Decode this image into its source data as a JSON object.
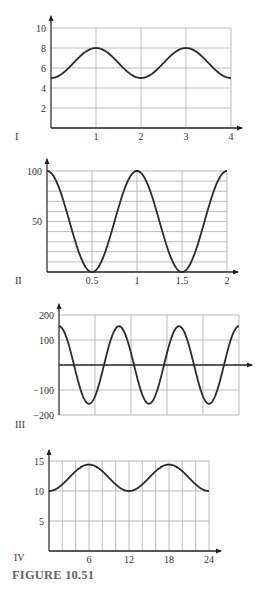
{
  "caption": "FIGURE 10.51",
  "chart_data": [
    {
      "id": "I",
      "type": "line",
      "panel_label": "I",
      "title": "",
      "xlabel": "",
      "ylabel": "",
      "xlim": [
        0,
        4
      ],
      "ylim": [
        0,
        10
      ],
      "x_ticks": [
        1,
        2,
        3,
        4
      ],
      "x_tick_labels": [
        "1",
        "2",
        "3",
        "4"
      ],
      "y_ticks": [
        2,
        4,
        6,
        8,
        10
      ],
      "y_tick_labels": [
        "2",
        "4",
        "6",
        "8",
        "10"
      ],
      "grid": true,
      "v_grid": [
        1,
        2,
        3,
        4
      ],
      "h_grid": [
        2,
        4,
        6,
        8,
        10
      ],
      "series": [
        {
          "name": "curve",
          "formula": "6.5 - 1.5*cos(pi*x)",
          "x": [
            0,
            0.5,
            1,
            1.5,
            2,
            2.5,
            3,
            3.5,
            4
          ],
          "values": [
            5,
            6.5,
            8,
            6.5,
            5,
            6.5,
            8,
            6.5,
            5
          ]
        }
      ],
      "px": {
        "x0": 51,
        "x1": 231,
        "y0": 128,
        "y1": 28,
        "yTop": 16,
        "xArrow": 242,
        "labelX": 15,
        "labelY": 140
      }
    },
    {
      "id": "II",
      "type": "line",
      "panel_label": "II",
      "title": "",
      "xlabel": "",
      "ylabel": "",
      "xlim": [
        0,
        2
      ],
      "ylim": [
        0,
        100
      ],
      "x_ticks": [
        0.5,
        1,
        1.5,
        2
      ],
      "x_tick_labels": [
        "0.5",
        "1",
        "1.5",
        "2"
      ],
      "y_ticks": [
        50,
        100
      ],
      "y_tick_labels": [
        "50",
        "100"
      ],
      "grid": true,
      "v_grid": [
        0.5,
        1,
        1.5,
        2
      ],
      "h_grid": [
        10,
        20,
        30,
        40,
        50,
        60,
        70,
        80,
        90,
        100
      ],
      "series": [
        {
          "name": "curve",
          "formula": "50 + 50*cos(2*pi*x)",
          "x": [
            0,
            0.25,
            0.5,
            0.75,
            1,
            1.25,
            1.5,
            1.75,
            2
          ],
          "values": [
            100,
            50,
            0,
            50,
            100,
            50,
            0,
            50,
            100
          ]
        }
      ],
      "px": {
        "x0": 47,
        "x1": 227,
        "y0": 272,
        "y1": 171,
        "yTop": 159,
        "xArrow": 238,
        "labelX": 15,
        "labelY": 284
      }
    },
    {
      "id": "III",
      "type": "line",
      "panel_label": "III",
      "title": "",
      "xlabel": "",
      "ylabel": "",
      "xlim": [
        0,
        5
      ],
      "ylim": [
        -200,
        200
      ],
      "x_ticks": [],
      "x_tick_labels": [],
      "y_ticks": [
        200,
        100,
        -100,
        -200
      ],
      "y_tick_labels": [
        "200",
        "100",
        "−100",
        "−200"
      ],
      "grid": true,
      "v_grid": [
        1,
        2,
        3,
        4,
        5
      ],
      "h_grid": [
        -200,
        -100,
        100,
        200
      ],
      "series": [
        {
          "name": "curve",
          "formula": "155*cos(2*pi*x*3/5)",
          "x": [
            0,
            0.833,
            1.667,
            2.5,
            3.333,
            4.167,
            5
          ],
          "values": [
            155,
            -155,
            155,
            -155,
            155,
            -155,
            155
          ]
        }
      ],
      "px": {
        "x0": 59,
        "x1": 239,
        "y0": 365,
        "y1": 315,
        "yTop": 304,
        "xArrow": 252,
        "yBottom": 415,
        "labelX": 15,
        "labelY": 428
      }
    },
    {
      "id": "IV",
      "type": "line",
      "panel_label": "IV",
      "title": "",
      "xlabel": "",
      "ylabel": "",
      "xlim": [
        0,
        24
      ],
      "ylim": [
        0,
        15
      ],
      "x_ticks": [
        6,
        12,
        18,
        24
      ],
      "x_tick_labels": [
        "6",
        "12",
        "18",
        "24"
      ],
      "y_ticks": [
        5,
        10,
        15
      ],
      "y_tick_labels": [
        "5",
        "10",
        "15"
      ],
      "grid": true,
      "v_grid": [
        2,
        4,
        6,
        8,
        10,
        12,
        14,
        16,
        18,
        20,
        22,
        24
      ],
      "h_grid": [
        5,
        10,
        15
      ],
      "series": [
        {
          "name": "curve",
          "formula": "12.2 - 2.2*cos(pi*x/6)",
          "x": [
            0,
            3,
            6,
            9,
            12,
            15,
            18,
            21,
            24
          ],
          "values": [
            10,
            12.2,
            14.4,
            12.2,
            10,
            12.2,
            14.4,
            12.2,
            10
          ]
        }
      ],
      "px": {
        "x0": 49,
        "x1": 209,
        "y0": 551,
        "y1": 461,
        "yTop": 450,
        "xArrow": 221,
        "labelX": 14,
        "labelY": 561
      }
    }
  ]
}
